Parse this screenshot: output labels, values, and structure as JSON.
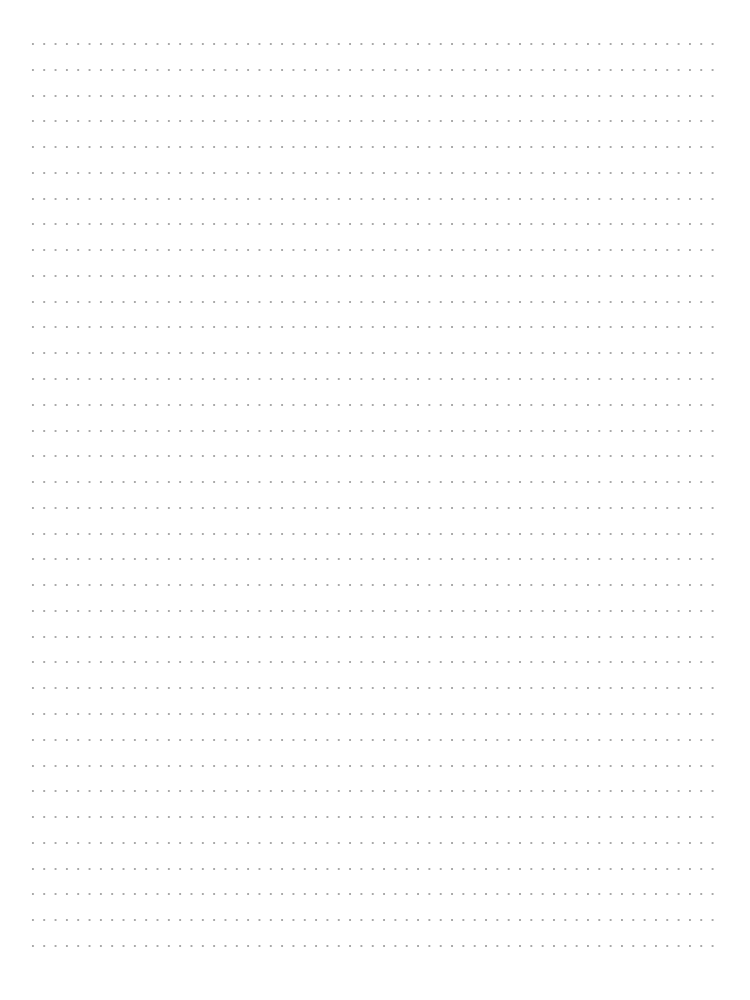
{
  "page": {
    "type": "dotted-line writing paper",
    "background_color": "#ffffff",
    "dot_color": "#a9a9a9",
    "row_count": 36,
    "first_row_y": 44,
    "row_spacing": 25.77,
    "dot_spacing": 11.33,
    "left_margin": 33,
    "right_edge": 714
  }
}
